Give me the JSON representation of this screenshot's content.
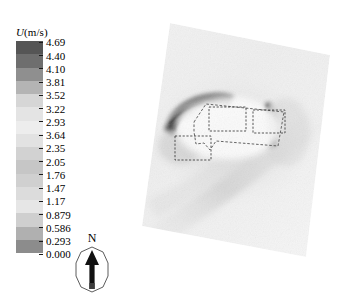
{
  "figure": {
    "type": "contour-map"
  },
  "legend": {
    "title_variable": "U",
    "title_units": "(m/s)",
    "title_full": "U(m/s)",
    "orientation": "vertical",
    "levels": [
      {
        "value": "4.69",
        "swatch": "#555555"
      },
      {
        "value": "4.40",
        "swatch": "#6e6e6e"
      },
      {
        "value": "4.10",
        "swatch": "#8f8f8f"
      },
      {
        "value": "3.81",
        "swatch": "#b4b4b4"
      },
      {
        "value": "3.52",
        "swatch": "#d6d6d6"
      },
      {
        "value": "3.22",
        "swatch": "#e4e4e4"
      },
      {
        "value": "2.93",
        "swatch": "#ededed"
      },
      {
        "value": "3.64",
        "swatch": "#e2e2e2"
      },
      {
        "value": "2.35",
        "swatch": "#d2d2d2"
      },
      {
        "value": "2.05",
        "swatch": "#c6c6c6"
      },
      {
        "value": "1.76",
        "swatch": "#d0d0d0"
      },
      {
        "value": "1.47",
        "swatch": "#dcdcdc"
      },
      {
        "value": "1.17",
        "swatch": "#e6e6e6"
      },
      {
        "value": "0.879",
        "swatch": "#cfcfcf"
      },
      {
        "value": "0.586",
        "swatch": "#b0b0b0"
      },
      {
        "value": "0.293",
        "swatch": "#8c8c8c"
      },
      {
        "value": "0.000",
        "swatch": "#5a5a5a"
      }
    ]
  },
  "north_arrow": {
    "label": "N"
  },
  "chart_data": {
    "type": "heatmap",
    "title": "",
    "xlabel": "",
    "ylabel": "",
    "colorbar_label": "U(m/s)",
    "colormap": "grayscale",
    "value_range": [
      0.0,
      4.69
    ],
    "tick_values": [
      4.69,
      4.4,
      4.1,
      3.81,
      3.52,
      3.22,
      2.93,
      3.64,
      2.35,
      2.05,
      1.76,
      1.47,
      1.17,
      0.879,
      0.586,
      0.293,
      0.0
    ],
    "grid": false,
    "legend_position": "left",
    "domain": {
      "shape": "rotated-square",
      "rotation_deg": -13,
      "note": "Pedestrian-level wind speed field over an urban block"
    },
    "features": [
      {
        "name": "upwind-corner-acceleration-band",
        "location": "left of building cluster",
        "relative_speed": "high",
        "shade": "dark"
      },
      {
        "name": "lateral-edge-streak",
        "location": "right of building cluster",
        "relative_speed": "high",
        "shade": "dark"
      },
      {
        "name": "downstream-wake-band",
        "location": "lower-center, diagonal",
        "relative_speed": "moderate",
        "shade": "light-gray"
      },
      {
        "name": "sheltered-zone",
        "location": "inside building cluster",
        "relative_speed": "low",
        "shade": "white"
      }
    ],
    "buildings": [
      {
        "name": "building-block-a",
        "position": "upper-left of cluster"
      },
      {
        "name": "building-block-b",
        "position": "upper-right of cluster"
      },
      {
        "name": "building-block-c",
        "position": "lower-left of cluster"
      },
      {
        "name": "building-site-outline",
        "position": "enclosing polygon"
      }
    ]
  }
}
